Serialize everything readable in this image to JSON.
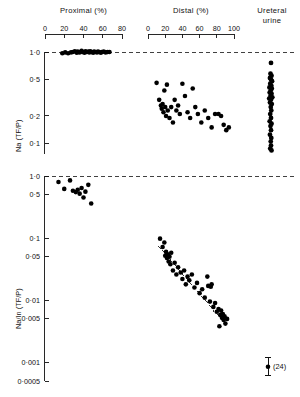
{
  "figure": {
    "background": "#ffffff",
    "ink": "#111111",
    "marker_color": "#000000"
  },
  "top_axes": {
    "proximal": {
      "title": "Proximal (%)",
      "ticks": [
        "0",
        "20",
        "40",
        "60",
        "80"
      ],
      "range": [
        0,
        80
      ]
    },
    "distal": {
      "title": "Distal (%)",
      "ticks": [
        "0",
        "20",
        "40",
        "60",
        "80",
        "100"
      ],
      "range": [
        0,
        100
      ]
    },
    "ureteral": {
      "title_line1": "Ureteral",
      "title_line2": "urine"
    }
  },
  "panel_top": {
    "ylabel": "Na (TF/P)",
    "yticks": [
      "1·0",
      "0·5",
      "0·2",
      "0·1"
    ],
    "ytick_values": [
      1.0,
      0.5,
      0.2,
      0.1
    ],
    "reference_line": 1.0
  },
  "panel_bottom": {
    "ylabel": "Na/In (TF/P)",
    "yticks": [
      "1·0",
      "0·5",
      "0·1",
      "0·05",
      "0·01",
      "0·005",
      "0·001",
      "0·0005"
    ],
    "ytick_values": [
      1.0,
      0.5,
      0.1,
      0.05,
      0.01,
      0.005,
      0.001,
      0.0005
    ],
    "reference_line": 1.0,
    "error_bar_label": "(24)"
  },
  "chart_data": {
    "type": "scatter",
    "title": "",
    "panels": [
      {
        "name": "panel_top",
        "ylabel": "Na (TF/P)",
        "yscale": "log",
        "ylim": [
          0.07,
          1.25
        ],
        "yticks": [
          1.0,
          0.5,
          0.2,
          0.1
        ],
        "ytick_labels": [
          "1·0",
          "0·5",
          "0·2",
          "0·1"
        ],
        "grid": false,
        "reference_lines": [
          {
            "y": 1.0,
            "style": "dashed"
          }
        ],
        "series": [
          {
            "name": "Proximal",
            "xlabel": "Proximal (%)",
            "xlim": [
              0,
              80
            ],
            "xticks": [
              0,
              20,
              40,
              60,
              80
            ],
            "points": [
              {
                "x": 18,
                "y": 0.97
              },
              {
                "x": 21,
                "y": 0.99
              },
              {
                "x": 24,
                "y": 0.97
              },
              {
                "x": 27,
                "y": 0.99
              },
              {
                "x": 29,
                "y": 1.0
              },
              {
                "x": 31,
                "y": 1.02
              },
              {
                "x": 33,
                "y": 0.98
              },
              {
                "x": 34,
                "y": 1.01
              },
              {
                "x": 36,
                "y": 0.99
              },
              {
                "x": 38,
                "y": 1.03
              },
              {
                "x": 39,
                "y": 1.0
              },
              {
                "x": 41,
                "y": 0.98
              },
              {
                "x": 42,
                "y": 1.02
              },
              {
                "x": 43,
                "y": 1.0
              },
              {
                "x": 45,
                "y": 1.01
              },
              {
                "x": 46,
                "y": 0.99
              },
              {
                "x": 47,
                "y": 1.02
              },
              {
                "x": 48,
                "y": 1.0
              },
              {
                "x": 50,
                "y": 0.98
              },
              {
                "x": 51,
                "y": 1.01
              },
              {
                "x": 52,
                "y": 1.0
              },
              {
                "x": 54,
                "y": 0.99
              },
              {
                "x": 55,
                "y": 1.01
              },
              {
                "x": 56,
                "y": 1.0
              },
              {
                "x": 58,
                "y": 0.98
              },
              {
                "x": 59,
                "y": 1.0
              },
              {
                "x": 61,
                "y": 1.01
              },
              {
                "x": 63,
                "y": 0.99
              },
              {
                "x": 65,
                "y": 1.0
              },
              {
                "x": 67,
                "y": 1.0
              }
            ]
          },
          {
            "name": "Distal",
            "xlabel": "Distal (%)",
            "xlim": [
              0,
              100
            ],
            "xticks": [
              0,
              20,
              40,
              60,
              80,
              100
            ],
            "points": [
              {
                "x": 10,
                "y": 0.46
              },
              {
                "x": 13,
                "y": 0.3
              },
              {
                "x": 15,
                "y": 0.26
              },
              {
                "x": 16,
                "y": 0.24
              },
              {
                "x": 17,
                "y": 0.27
              },
              {
                "x": 18,
                "y": 0.22
              },
              {
                "x": 19,
                "y": 0.38
              },
              {
                "x": 20,
                "y": 0.25
              },
              {
                "x": 21,
                "y": 0.2
              },
              {
                "x": 22,
                "y": 0.44
              },
              {
                "x": 23,
                "y": 0.23
              },
              {
                "x": 25,
                "y": 0.19
              },
              {
                "x": 27,
                "y": 0.25
              },
              {
                "x": 29,
                "y": 0.17
              },
              {
                "x": 31,
                "y": 0.3
              },
              {
                "x": 33,
                "y": 0.23
              },
              {
                "x": 35,
                "y": 0.26
              },
              {
                "x": 37,
                "y": 0.21
              },
              {
                "x": 40,
                "y": 0.45
              },
              {
                "x": 43,
                "y": 0.33
              },
              {
                "x": 46,
                "y": 0.22
              },
              {
                "x": 49,
                "y": 0.19
              },
              {
                "x": 52,
                "y": 0.4
              },
              {
                "x": 55,
                "y": 0.25
              },
              {
                "x": 58,
                "y": 0.21
              },
              {
                "x": 62,
                "y": 0.17
              },
              {
                "x": 66,
                "y": 0.23
              },
              {
                "x": 70,
                "y": 0.19
              },
              {
                "x": 74,
                "y": 0.15
              },
              {
                "x": 78,
                "y": 0.21
              },
              {
                "x": 82,
                "y": 0.21
              },
              {
                "x": 85,
                "y": 0.2
              },
              {
                "x": 88,
                "y": 0.16
              },
              {
                "x": 91,
                "y": 0.14
              },
              {
                "x": 94,
                "y": 0.15
              }
            ]
          },
          {
            "name": "Ureteral urine",
            "xlabel": "Ureteral urine",
            "points": [
              {
                "x": 0.5,
                "y": 0.76
              },
              {
                "x": 0.48,
                "y": 0.58
              },
              {
                "x": 0.52,
                "y": 0.55
              },
              {
                "x": 0.46,
                "y": 0.52
              },
              {
                "x": 0.5,
                "y": 0.5
              },
              {
                "x": 0.54,
                "y": 0.48
              },
              {
                "x": 0.47,
                "y": 0.45
              },
              {
                "x": 0.51,
                "y": 0.43
              },
              {
                "x": 0.44,
                "y": 0.41
              },
              {
                "x": 0.53,
                "y": 0.4
              },
              {
                "x": 0.49,
                "y": 0.38
              },
              {
                "x": 0.45,
                "y": 0.36
              },
              {
                "x": 0.52,
                "y": 0.35
              },
              {
                "x": 0.48,
                "y": 0.33
              },
              {
                "x": 0.55,
                "y": 0.32
              },
              {
                "x": 0.43,
                "y": 0.31
              },
              {
                "x": 0.5,
                "y": 0.3
              },
              {
                "x": 0.46,
                "y": 0.28
              },
              {
                "x": 0.53,
                "y": 0.27
              },
              {
                "x": 0.49,
                "y": 0.25
              },
              {
                "x": 0.51,
                "y": 0.23
              },
              {
                "x": 0.47,
                "y": 0.21
              },
              {
                "x": 0.5,
                "y": 0.19
              },
              {
                "x": 0.45,
                "y": 0.175
              },
              {
                "x": 0.52,
                "y": 0.165
              },
              {
                "x": 0.48,
                "y": 0.155
              },
              {
                "x": 0.5,
                "y": 0.14
              },
              {
                "x": 0.46,
                "y": 0.125
              },
              {
                "x": 0.51,
                "y": 0.115
              },
              {
                "x": 0.49,
                "y": 0.105
              },
              {
                "x": 0.5,
                "y": 0.095
              },
              {
                "x": 0.47,
                "y": 0.088
              },
              {
                "x": 0.52,
                "y": 0.084
              }
            ]
          }
        ]
      },
      {
        "name": "panel_bottom",
        "ylabel": "Na/In (TF/P)",
        "yscale": "log",
        "ylim": [
          0.0005,
          1.3
        ],
        "yticks": [
          1.0,
          0.5,
          0.1,
          0.05,
          0.01,
          0.005,
          0.001,
          0.0005
        ],
        "ytick_labels": [
          "1·0",
          "0·5",
          "0·1",
          "0·05",
          "0·01",
          "0·005",
          "0·001",
          "0·0005"
        ],
        "grid": false,
        "reference_lines": [
          {
            "y": 1.0,
            "style": "dashed"
          }
        ],
        "regression_line": {
          "style": "dashed",
          "x_start": 12,
          "y_start": 0.075,
          "x_end": 88,
          "y_end": 0.0045
        },
        "error_bar": {
          "label": "(24)",
          "y": 0.00085,
          "y_low": 0.00062,
          "y_high": 0.00118
        },
        "series": [
          {
            "name": "Proximal",
            "xlabel": "Proximal (%)",
            "xlim": [
              0,
              80
            ],
            "xticks": [
              0,
              20,
              40,
              60,
              80
            ],
            "points": [
              {
                "x": 14,
                "y": 0.8
              },
              {
                "x": 20,
                "y": 0.62
              },
              {
                "x": 26,
                "y": 0.85
              },
              {
                "x": 29,
                "y": 0.58
              },
              {
                "x": 32,
                "y": 0.55
              },
              {
                "x": 34,
                "y": 0.6
              },
              {
                "x": 36,
                "y": 0.52
              },
              {
                "x": 38,
                "y": 0.64
              },
              {
                "x": 40,
                "y": 0.45
              },
              {
                "x": 42,
                "y": 0.56
              },
              {
                "x": 45,
                "y": 0.72
              },
              {
                "x": 48,
                "y": 0.36
              }
            ]
          },
          {
            "name": "Distal",
            "xlabel": "Distal (%)",
            "xlim": [
              0,
              100
            ],
            "xticks": [
              0,
              20,
              40,
              60,
              80,
              100
            ],
            "points": [
              {
                "x": 14,
                "y": 0.098
              },
              {
                "x": 17,
                "y": 0.072
              },
              {
                "x": 19,
                "y": 0.085
              },
              {
                "x": 20,
                "y": 0.052
              },
              {
                "x": 21,
                "y": 0.06
              },
              {
                "x": 22,
                "y": 0.048
              },
              {
                "x": 23,
                "y": 0.055
              },
              {
                "x": 24,
                "y": 0.042
              },
              {
                "x": 25,
                "y": 0.05
              },
              {
                "x": 26,
                "y": 0.038
              },
              {
                "x": 27,
                "y": 0.058
              },
              {
                "x": 29,
                "y": 0.03
              },
              {
                "x": 31,
                "y": 0.04
              },
              {
                "x": 33,
                "y": 0.026
              },
              {
                "x": 35,
                "y": 0.034
              },
              {
                "x": 38,
                "y": 0.028
              },
              {
                "x": 40,
                "y": 0.022
              },
              {
                "x": 42,
                "y": 0.03
              },
              {
                "x": 44,
                "y": 0.018
              },
              {
                "x": 46,
                "y": 0.024
              },
              {
                "x": 48,
                "y": 0.021
              },
              {
                "x": 51,
                "y": 0.026
              },
              {
                "x": 54,
                "y": 0.016
              },
              {
                "x": 57,
                "y": 0.019
              },
              {
                "x": 60,
                "y": 0.013
              },
              {
                "x": 63,
                "y": 0.015
              },
              {
                "x": 66,
                "y": 0.011
              },
              {
                "x": 69,
                "y": 0.024
              },
              {
                "x": 72,
                "y": 0.0095
              },
              {
                "x": 74,
                "y": 0.018
              },
              {
                "x": 76,
                "y": 0.0078
              },
              {
                "x": 78,
                "y": 0.009
              },
              {
                "x": 80,
                "y": 0.0065
              },
              {
                "x": 82,
                "y": 0.0072
              },
              {
                "x": 84,
                "y": 0.0058
              },
              {
                "x": 85,
                "y": 0.0068
              },
              {
                "x": 86,
                "y": 0.0052
              },
              {
                "x": 87,
                "y": 0.006
              },
              {
                "x": 88,
                "y": 0.0048
              },
              {
                "x": 89,
                "y": 0.0055
              },
              {
                "x": 90,
                "y": 0.0042
              },
              {
                "x": 92,
                "y": 0.005
              },
              {
                "x": 83,
                "y": 0.0038
              },
              {
                "x": 70,
                "y": 0.017
              },
              {
                "x": 73,
                "y": 0.0165
              }
            ]
          }
        ]
      }
    ]
  }
}
